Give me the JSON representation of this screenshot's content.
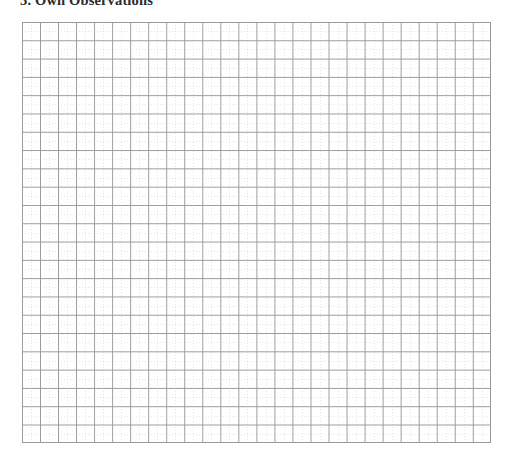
{
  "page": {
    "width": 513,
    "height": 469,
    "background_color": "#ffffff",
    "kind": "scanned-worksheet-page"
  },
  "heading": {
    "text": "3. Own Observations",
    "section_number": "3.",
    "title": "Own Observations",
    "style": "bold",
    "clipped_at_top_edge": true,
    "color": "#2b2b2b"
  },
  "grid": {
    "label": "blank graph paper grid",
    "content": "",
    "left": 22,
    "top": 22,
    "width": 469,
    "height": 421,
    "columns": 26,
    "rows": 23,
    "major_cell_size_px": 18,
    "minor_subdivisions_per_cell": 2,
    "major_line_color": "#9a9a9a",
    "minor_line_color": "#afafaf",
    "minor_line_style": "dotted",
    "border_color": "#9a9a9a",
    "fill_color": "#ffffff",
    "is_empty": true
  }
}
